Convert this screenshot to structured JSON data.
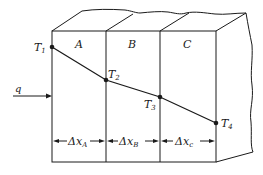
{
  "diagram": {
    "type": "composite-wall-heat-conduction",
    "heat_flux_label": "q",
    "layers": [
      {
        "id": "A",
        "label": "A",
        "thickness_label": "Δx",
        "thickness_sub": "A"
      },
      {
        "id": "B",
        "label": "B",
        "thickness_label": "Δx",
        "thickness_sub": "B"
      },
      {
        "id": "C",
        "label": "C",
        "thickness_label": "Δx",
        "thickness_sub": "c"
      }
    ],
    "temperatures": [
      {
        "label": "T",
        "sub": "1"
      },
      {
        "label": "T",
        "sub": "2"
      },
      {
        "label": "T",
        "sub": "3"
      },
      {
        "label": "T",
        "sub": "4"
      }
    ],
    "colors": {
      "line": "#1a1a1a",
      "background": "#ffffff"
    }
  }
}
